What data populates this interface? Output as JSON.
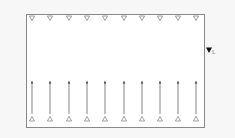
{
  "diagram": {
    "frame": {
      "x": 26,
      "y": 14,
      "width": 178,
      "height": 113,
      "stroke": "#888888",
      "fill": "#ffffff"
    },
    "top_markers": {
      "shape": "down-triangle-outline",
      "y": 18,
      "xs": [
        32,
        50,
        69,
        87,
        105,
        124,
        142,
        160,
        178,
        196
      ]
    },
    "bottom_markers": {
      "shape": "up-triangle-outline",
      "y": 119,
      "xs": [
        32,
        50,
        69,
        87,
        105,
        124,
        142,
        160,
        178,
        196
      ]
    },
    "arrows": {
      "from_y": 114,
      "to_y": 81,
      "xs": [
        32,
        50,
        69,
        87,
        105,
        124,
        142,
        160,
        178,
        196
      ],
      "color": "#333333"
    },
    "level_marker": {
      "shape": "down-triangle-filled",
      "x": 209,
      "y": 50,
      "subscript": "L"
    }
  }
}
